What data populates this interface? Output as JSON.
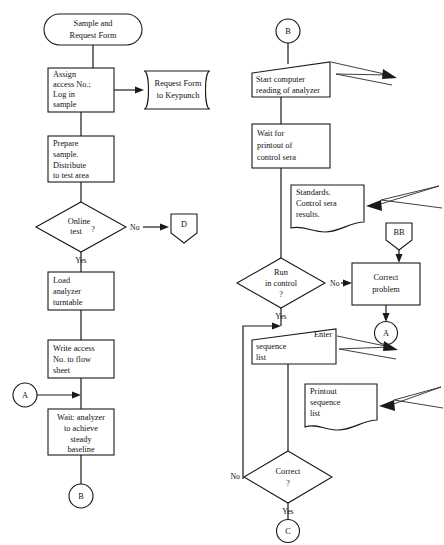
{
  "diagram": {
    "stroke_color": "#1a1a1a",
    "background_color": "#ffffff",
    "text_color": "#111111"
  },
  "left_column": {
    "start_terminator": {
      "shape": "rounded-terminator",
      "lines": [
        "Sample and",
        "Request Form"
      ]
    },
    "assign_access": {
      "shape": "process",
      "lines": [
        "Assign",
        "access No.;",
        "Log in",
        "sample"
      ]
    },
    "request_form_keypunch": {
      "shape": "stored-data",
      "lines": [
        "Request Form",
        "to Keypunch"
      ]
    },
    "prepare_sample": {
      "shape": "process",
      "lines": [
        "Prepare",
        "sample.",
        "Distribute",
        "to test area"
      ]
    },
    "online_test_decision": {
      "shape": "decision",
      "lines": [
        "Online",
        "test"
      ],
      "question_mark": "?",
      "branch_no": "No",
      "branch_yes": "Yes"
    },
    "connector_d": {
      "shape": "offpage-pentagon-down",
      "label": "D"
    },
    "load_analyzer": {
      "shape": "process",
      "lines": [
        "Load",
        "analyzer",
        "turntable"
      ]
    },
    "write_access": {
      "shape": "process",
      "lines": [
        "Write access",
        "No. to flow",
        "sheet"
      ]
    },
    "connector_a_in": {
      "shape": "circle-connector",
      "label": "A"
    },
    "wait_analyzer": {
      "shape": "process",
      "lines": [
        "Wait: analyzer",
        "to achieve",
        "steady",
        "baseline"
      ]
    },
    "connector_b_out": {
      "shape": "circle-connector",
      "label": "B"
    }
  },
  "right_column": {
    "connector_b_in": {
      "shape": "circle-connector",
      "label": "B"
    },
    "start_computer": {
      "shape": "manual-operation",
      "lines": [
        "Start computer",
        "reading of analyzer"
      ]
    },
    "wait_printout": {
      "shape": "process",
      "lines": [
        "Wait for",
        "printout of",
        "control sera"
      ]
    },
    "standards_doc": {
      "shape": "document",
      "lines": [
        "Standards.",
        "Control sera",
        "results."
      ]
    },
    "connector_bb": {
      "shape": "offpage-pentagon-down",
      "label": "BB"
    },
    "run_in_control_decision": {
      "shape": "decision",
      "lines": [
        "Run",
        "in control"
      ],
      "question_mark": "?",
      "branch_no": "No",
      "branch_yes": "Yes"
    },
    "correct_problem": {
      "shape": "process",
      "lines": [
        "Correct",
        "problem"
      ]
    },
    "connector_a_out": {
      "shape": "circle-connector",
      "label": "A"
    },
    "enter_sequence": {
      "shape": "manual-input",
      "lines": [
        "Enter",
        "sequence",
        "list"
      ]
    },
    "printout_sequence_doc": {
      "shape": "document",
      "lines": [
        "Printout",
        "sequence",
        "list"
      ]
    },
    "correct_decision": {
      "shape": "decision",
      "lines": [
        "Correct"
      ],
      "question_mark": "?",
      "branch_no": "No",
      "branch_yes": "Yes"
    },
    "connector_c_out": {
      "shape": "circle-connector",
      "label": "C"
    }
  },
  "callouts": [
    {
      "name": "callout-start-computer",
      "points": "331,62 389,75 336,74 397,86"
    },
    {
      "name": "callout-standards",
      "points": "365,189 435,185 373,199 439,206"
    },
    {
      "name": "callout-enter-sequence",
      "points": "337,334 391,345 343,347 398,356"
    },
    {
      "name": "callout-printout",
      "points": "389,390 441,384 393,399 444,404"
    }
  ]
}
